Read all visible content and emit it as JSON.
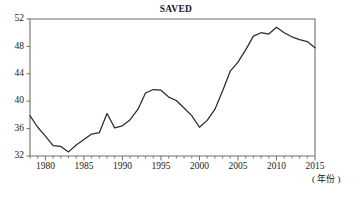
{
  "chart_data": {
    "type": "line",
    "title": "SAVED",
    "xlabel": "( 年份 )",
    "ylabel": "",
    "xlim": [
      1978,
      2015
    ],
    "ylim": [
      32,
      52
    ],
    "grid": false,
    "legend": null,
    "y_ticks": [
      32,
      36,
      40,
      44,
      48,
      52
    ],
    "x_ticks": [
      1980,
      1985,
      1990,
      1995,
      2000,
      2005,
      2010,
      2015
    ],
    "x_minor_tick_step": 1,
    "series": [
      {
        "name": "SAVED",
        "color": "#2b2b2b",
        "x": [
          1978,
          1979,
          1980,
          1981,
          1982,
          1983,
          1984,
          1985,
          1986,
          1987,
          1988,
          1989,
          1990,
          1991,
          1992,
          1993,
          1994,
          1995,
          1996,
          1997,
          1998,
          1999,
          2000,
          2001,
          2002,
          2003,
          2004,
          2005,
          2006,
          2007,
          2008,
          2009,
          2010,
          2011,
          2012,
          2013,
          2014,
          2015
        ],
        "values": [
          37.9,
          36.2,
          34.9,
          33.5,
          33.4,
          32.6,
          33.6,
          34.4,
          35.2,
          35.4,
          38.2,
          36.1,
          36.4,
          37.3,
          38.8,
          41.2,
          41.7,
          41.6,
          40.6,
          40.1,
          39.0,
          37.9,
          36.2,
          37.2,
          38.8,
          41.5,
          44.4,
          45.7,
          47.5,
          49.5,
          50.0,
          49.8,
          50.8,
          50.0,
          49.4,
          49.0,
          48.7,
          47.8
        ]
      }
    ],
    "annotations": []
  },
  "figure": {
    "title_text": "SAVED",
    "x_axis_caption": "( 年份 )"
  }
}
